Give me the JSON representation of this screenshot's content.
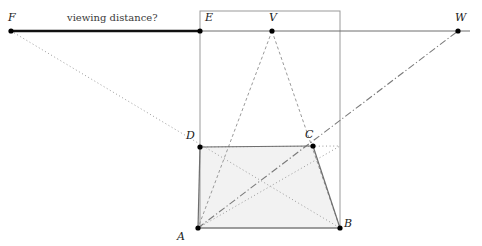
{
  "figure": {
    "type": "geometry-diagram",
    "width": 482,
    "height": 246,
    "background": "#ffffff",
    "annotation_text": "viewing distance?"
  },
  "colors": {
    "line_solid": "#6e6e6e",
    "line_thick": "#111111",
    "line_dashed": "#9a9a9a",
    "line_dotted": "#9a9a9a",
    "line_dashdot": "#7a7a7a",
    "point_fill": "#000000",
    "shade_fill": "#f2f2f2",
    "label_text": "#1a1a1a",
    "rect_stroke": "#9a9a9a"
  },
  "points": [
    {
      "id": "F",
      "label": "F",
      "x": 11,
      "y": 31,
      "label_x": 8,
      "label_y": 12
    },
    {
      "id": "E",
      "label": "E",
      "x": 200,
      "y": 31,
      "label_x": 205,
      "label_y": 12
    },
    {
      "id": "V",
      "label": "V",
      "x": 272,
      "y": 31,
      "label_x": 269,
      "label_y": 12
    },
    {
      "id": "W",
      "label": "W",
      "x": 458,
      "y": 31,
      "label_x": 455,
      "label_y": 12
    },
    {
      "id": "D",
      "label": "D",
      "x": 200,
      "y": 147,
      "label_x": 186,
      "label_y": 130
    },
    {
      "id": "C",
      "label": "C",
      "x": 313,
      "y": 146,
      "label_x": 305,
      "label_y": 129
    },
    {
      "id": "A",
      "label": "A",
      "x": 198,
      "y": 228,
      "label_x": 177,
      "label_y": 231
    },
    {
      "id": "B",
      "label": "B",
      "x": 340,
      "y": 228,
      "label_x": 344,
      "label_y": 218
    }
  ],
  "labels": {
    "viewing_distance": "viewing distance?",
    "viewing_distance_x": 67,
    "viewing_distance_y": 13
  },
  "geometry": {
    "horizon_line": {
      "x1": 11,
      "y1": 31,
      "x2": 470,
      "y2": 31
    },
    "viewing_distance_segment": {
      "x1": 11,
      "y1": 31,
      "x2": 200,
      "y2": 31
    },
    "picture_plane_rect": {
      "x": 200,
      "y": 11,
      "w": 140,
      "h": 217
    },
    "trapezoid_points": "198,228 340,228 313,146 200,147",
    "edges_solid": [
      {
        "name": "AD",
        "x1": 198,
        "y1": 228,
        "x2": 200,
        "y2": 147
      },
      {
        "name": "DC",
        "x1": 200,
        "y1": 147,
        "x2": 313,
        "y2": 146
      },
      {
        "name": "CB",
        "x1": 313,
        "y1": 146,
        "x2": 340,
        "y2": 228
      },
      {
        "name": "AB",
        "x1": 198,
        "y1": 228,
        "x2": 340,
        "y2": 228
      }
    ],
    "edges_dashed": [
      {
        "name": "VA",
        "x1": 272,
        "y1": 31,
        "x2": 198,
        "y2": 228
      },
      {
        "name": "VB",
        "x1": 272,
        "y1": 31,
        "x2": 340,
        "y2": 228
      }
    ],
    "edges_dotted": [
      {
        "name": "FDB",
        "x1": 11,
        "y1": 31,
        "x2": 340,
        "y2": 228
      },
      {
        "name": "DCright",
        "x1": 200,
        "y1": 147,
        "x2": 340,
        "y2": 146
      },
      {
        "name": "ACdotted",
        "x1": 198,
        "y1": 228,
        "x2": 340,
        "y2": 146
      }
    ],
    "edges_dashdot": [
      {
        "name": "AW",
        "x1": 198,
        "y1": 228,
        "x2": 458,
        "y2": 31
      }
    ]
  }
}
